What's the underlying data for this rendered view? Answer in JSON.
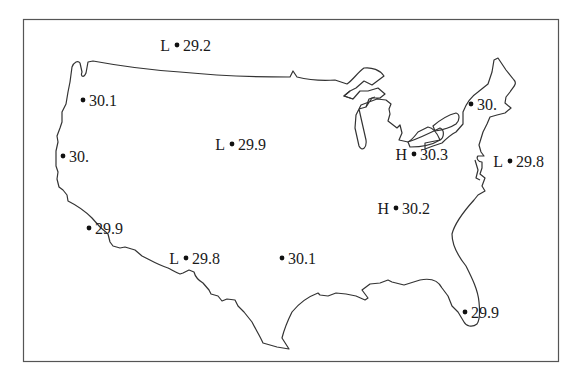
{
  "map": {
    "title": "",
    "region": "Contiguous United States",
    "units": "",
    "colors": {
      "outline": "#333333",
      "text": "#1a1a1a",
      "frame": "#555555"
    },
    "stations": [
      {
        "id": "s0",
        "type": "L",
        "value": "29.2",
        "x": 177,
        "y": 45
      },
      {
        "id": "s1",
        "type": "",
        "value": "30.1",
        "x": 83,
        "y": 100
      },
      {
        "id": "s2",
        "type": "L",
        "value": "29.9",
        "x": 232,
        "y": 144
      },
      {
        "id": "s3",
        "type": "",
        "value": "30.",
        "x": 63,
        "y": 156
      },
      {
        "id": "s4",
        "type": "",
        "value": "30.",
        "x": 471,
        "y": 104
      },
      {
        "id": "s5",
        "type": "H",
        "value": "30.3",
        "x": 414,
        "y": 154
      },
      {
        "id": "s6",
        "type": "L",
        "value": "29.8",
        "x": 510,
        "y": 161
      },
      {
        "id": "s7",
        "type": "H",
        "value": "30.2",
        "x": 396,
        "y": 208
      },
      {
        "id": "s8",
        "type": "",
        "value": "29.9",
        "x": 89,
        "y": 228
      },
      {
        "id": "s9",
        "type": "L",
        "value": "29.8",
        "x": 186,
        "y": 258
      },
      {
        "id": "s10",
        "type": "",
        "value": "30.1",
        "x": 282,
        "y": 258
      },
      {
        "id": "s11",
        "type": "",
        "value": "29.9",
        "x": 465,
        "y": 312
      }
    ]
  }
}
